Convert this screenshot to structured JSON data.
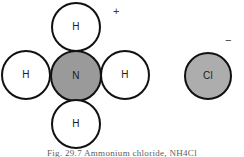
{
  "figure": {
    "background_color": "#ffffff"
  },
  "colors": {
    "outline": "#111111",
    "hydrogen_fill": "#ffffff",
    "nitrogen_fill": "#9a9a9a",
    "chlorine_fill": "#adadad",
    "label_text": "#1a1a1a",
    "caption_text": "#5d5d5d"
  },
  "ammonium_ion": {
    "name": "ammonium",
    "charge_symbol": "+",
    "atoms": [
      {
        "symbol": "H",
        "role": "hydrogen-top"
      },
      {
        "symbol": "H",
        "role": "hydrogen-left"
      },
      {
        "symbol": "N",
        "role": "nitrogen-center"
      },
      {
        "symbol": "H",
        "role": "hydrogen-right"
      },
      {
        "symbol": "H",
        "role": "hydrogen-bottom"
      }
    ]
  },
  "chloride_ion": {
    "name": "chloride",
    "charge_symbol": "−",
    "atoms": [
      {
        "symbol": "Cl",
        "role": "chlorine"
      }
    ]
  },
  "caption": {
    "text": "Fig. 29.7   Ammonium chloride, NH4Cl"
  }
}
